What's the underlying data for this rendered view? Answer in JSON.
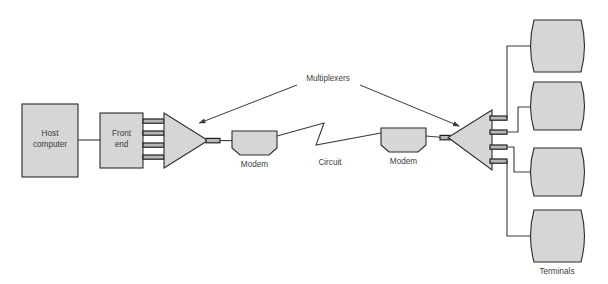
{
  "diagram": {
    "colors": {
      "shape_fill": "#d6d6d6",
      "shape_stroke": "#2b2b2b",
      "line": "#3a3a3a",
      "text": "#3d3d3d",
      "background": "#ffffff"
    },
    "nodes": {
      "host": {
        "line1": "Host",
        "line2": "computer"
      },
      "front_end": {
        "line1": "Front",
        "line2": "end"
      },
      "mux_label": "Multiplexers",
      "modem_left": "Modem",
      "modem_right": "Modem",
      "circuit": "Circuit",
      "terminals": "Terminals"
    },
    "counts": {
      "front_end_ports": 4,
      "terminal_count": 4
    }
  }
}
